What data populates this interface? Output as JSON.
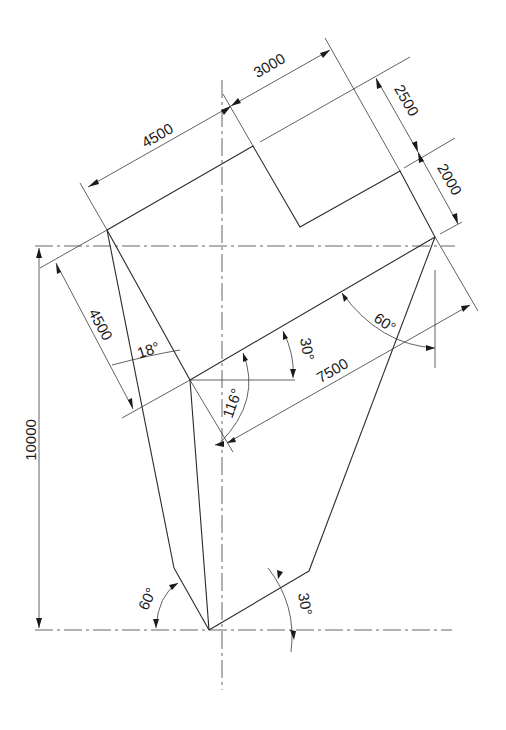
{
  "drawing": {
    "type": "technical drawing",
    "colors": {
      "line": "#2a2a2a",
      "background": "#ffffff"
    },
    "dimensions": {
      "top_left_length": "4500",
      "top_right_length": "3000",
      "right_upper_width": "2500",
      "right_lower_width": "2000",
      "left_width": "4500",
      "diagonal_length": "7500",
      "overall_height": "10000"
    },
    "angles": {
      "left_top": "18°",
      "center_wedge": "116°",
      "base_slope": "30°",
      "right_corner": "60°",
      "bottom_left": "60°",
      "bottom_right": "30°"
    }
  }
}
